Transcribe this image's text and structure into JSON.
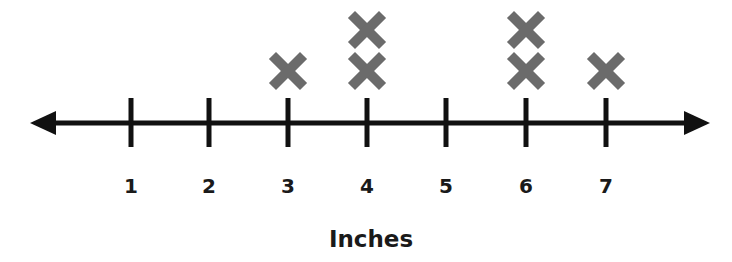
{
  "chart_data": {
    "type": "line-plot (dot plot)",
    "title": "",
    "xlabel": "Inches",
    "ylabel": "",
    "categories": [
      "1",
      "2",
      "3",
      "4",
      "5",
      "6",
      "7"
    ],
    "values": [
      0,
      0,
      1,
      2,
      0,
      2,
      1
    ],
    "marker": "X",
    "marker_color": "#6b6b6b",
    "axis_color": "#111111",
    "xlim": [
      1,
      7
    ],
    "grid": false,
    "legend": null,
    "axis_arrows": "both-ends"
  },
  "axis": {
    "title": "Inches",
    "ticks": [
      "1",
      "2",
      "3",
      "4",
      "5",
      "6",
      "7"
    ]
  }
}
